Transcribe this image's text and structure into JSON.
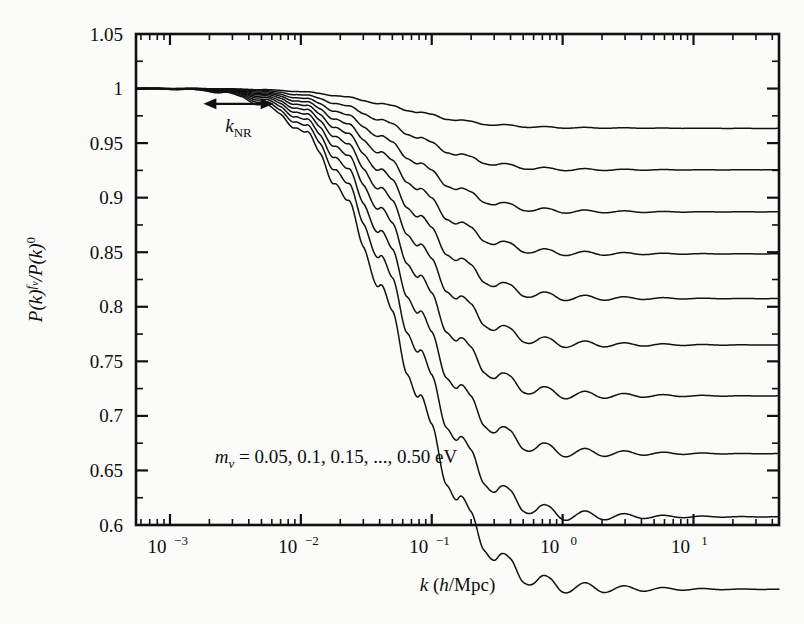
{
  "figure": {
    "background_color": "#fbfbf9",
    "line_color": "#111111",
    "axis_color": "#111111"
  },
  "axes": {
    "x_label_parts": {
      "k": "k",
      "open": " (",
      "h": "h",
      "rest": "/Mpc)"
    },
    "x_label": "k (h/Mpc)",
    "y_label": "P(k)^{f_v}/P(k)^0",
    "y_label_parts": {
      "p1": "P(k)",
      "sup1": "f",
      "sup1b": "v",
      "mid": "/P(k)",
      "sup2": "0"
    },
    "x_tick_labels": [
      "10-3",
      "10-2",
      "10-1",
      "100",
      "101"
    ],
    "x_tick_mantissa": "10",
    "x_tick_exponents": [
      "−3",
      "−2",
      "−1",
      "0",
      "1"
    ],
    "x_tick_values": [
      0.001,
      0.01,
      0.1,
      1,
      10
    ],
    "y_tick_labels": [
      "1.05",
      "1",
      "0.95",
      "0.9",
      "0.85",
      "0.8",
      "0.75",
      "0.7",
      "0.65",
      "0.6"
    ],
    "y_tick_values": [
      1.05,
      1,
      0.95,
      0.9,
      0.85,
      0.8,
      0.75,
      0.7,
      0.65,
      0.6
    ]
  },
  "annotations": {
    "arrow_label": "kNR",
    "arrow_label_parts": {
      "k": "k",
      "sub": "NR"
    },
    "arrow_x_range": [
      0.0018,
      0.0062
    ],
    "arrow_y": 0.986,
    "legend_text": "mv = 0.05, 0.1, 0.15, ..., 0.50 eV",
    "legend_parts": {
      "m": "m",
      "sub": "v",
      "rest": " = 0.05, 0.1, 0.15, ..., 0.50 eV"
    },
    "legend_x": 0.0022,
    "legend_y": 0.657
  },
  "chart_data": {
    "type": "line",
    "title": "",
    "xlabel": "k (h/Mpc)",
    "ylabel": "P(k)^{f_v}/P(k)^0",
    "xscale": "log",
    "yscale": "linear",
    "xlim": [
      0.00055,
      45
    ],
    "ylim": [
      0.6,
      1.05
    ],
    "grid": false,
    "legend": "annotation-inside-plot",
    "x": [
      0.00055,
      0.0008,
      0.0012,
      0.0018,
      0.0025,
      0.0035,
      0.005,
      0.007,
      0.009,
      0.011,
      0.014,
      0.018,
      0.023,
      0.03,
      0.04,
      0.05,
      0.065,
      0.08,
      0.1,
      0.13,
      0.16,
      0.2,
      0.25,
      0.32,
      0.4,
      0.5,
      0.65,
      0.8,
      1.0,
      1.4,
      2.0,
      3.0,
      5.0,
      8.0,
      13.0,
      20.0,
      30.0,
      45.0
    ],
    "series": [
      {
        "name": "m_v = 0.05 eV",
        "mass_eV": 0.05,
        "plateau": 0.9635,
        "values": [
          1.0,
          1.0,
          1.0,
          1.0,
          0.9998,
          0.9995,
          0.999,
          0.9983,
          0.9975,
          0.9968,
          0.9955,
          0.9938,
          0.9918,
          0.9893,
          0.9862,
          0.9838,
          0.9806,
          0.9782,
          0.9756,
          0.9727,
          0.9709,
          0.9692,
          0.9678,
          0.9665,
          0.9659,
          0.9653,
          0.9647,
          0.9644,
          0.9642,
          0.964,
          0.9639,
          0.9638,
          0.9637,
          0.9636,
          0.9636,
          0.9635,
          0.9635,
          0.9635
        ]
      },
      {
        "name": "m_v = 0.1 eV",
        "mass_eV": 0.1,
        "plateau": 0.9255,
        "values": [
          1.0,
          1.0,
          1.0,
          0.9999,
          0.9996,
          0.999,
          0.998,
          0.9965,
          0.995,
          0.9935,
          0.9908,
          0.9872,
          0.983,
          0.9778,
          0.9714,
          0.9664,
          0.9597,
          0.9548,
          0.9492,
          0.9432,
          0.9394,
          0.936,
          0.933,
          0.9303,
          0.929,
          0.9278,
          0.9267,
          0.9262,
          0.9259,
          0.9257,
          0.9256,
          0.9256,
          0.9255,
          0.9255,
          0.9255,
          0.9255,
          0.9255,
          0.9255
        ]
      },
      {
        "name": "m_v = 0.15 eV",
        "mass_eV": 0.15,
        "plateau": 0.8875,
        "values": [
          1.0,
          1.0,
          0.9999,
          0.9998,
          0.9993,
          0.9985,
          0.9969,
          0.9947,
          0.9924,
          0.9901,
          0.9861,
          0.9805,
          0.9741,
          0.9662,
          0.9564,
          0.9488,
          0.9386,
          0.9312,
          0.9227,
          0.9136,
          0.9078,
          0.9027,
          0.8982,
          0.8941,
          0.8922,
          0.8904,
          0.8888,
          0.8881,
          0.8876,
          0.8873,
          0.8872,
          0.8871,
          0.887,
          0.887,
          0.887,
          0.887,
          0.887,
          0.887
        ]
      },
      {
        "name": "m_v = 0.2 eV",
        "mass_eV": 0.2,
        "plateau": 0.8495,
        "values": [
          1.0,
          1.0,
          0.9999,
          0.9997,
          0.9991,
          0.998,
          0.9958,
          0.9929,
          0.9898,
          0.9867,
          0.9813,
          0.9738,
          0.9652,
          0.9546,
          0.9415,
          0.9313,
          0.9176,
          0.9077,
          0.8963,
          0.8841,
          0.8763,
          0.8695,
          0.8635,
          0.858,
          0.8554,
          0.853,
          0.8509,
          0.85,
          0.8493,
          0.8489,
          0.8487,
          0.8486,
          0.8486,
          0.8485,
          0.8485,
          0.8485,
          0.8485,
          0.8485
        ]
      },
      {
        "name": "m_v = 0.25 eV",
        "mass_eV": 0.25,
        "plateau": 0.8105,
        "values": [
          1.0,
          0.9999,
          0.9998,
          0.9995,
          0.9988,
          0.9974,
          0.9946,
          0.9909,
          0.987,
          0.9831,
          0.9762,
          0.9667,
          0.9558,
          0.9423,
          0.9256,
          0.9127,
          0.8953,
          0.8827,
          0.8683,
          0.8528,
          0.8429,
          0.8342,
          0.8267,
          0.8197,
          0.8164,
          0.8134,
          0.8107,
          0.8096,
          0.8087,
          0.8082,
          0.8079,
          0.8078,
          0.8077,
          0.8076,
          0.8076,
          0.8075,
          0.8075,
          0.8075
        ]
      },
      {
        "name": "m_v = 0.3 eV",
        "mass_eV": 0.3,
        "plateau": 0.7715,
        "values": [
          1.0,
          0.9999,
          0.9997,
          0.9993,
          0.9984,
          0.9967,
          0.9932,
          0.9886,
          0.9838,
          0.979,
          0.9705,
          0.9589,
          0.9455,
          0.9291,
          0.9086,
          0.8929,
          0.8717,
          0.8563,
          0.8388,
          0.8199,
          0.8079,
          0.7973,
          0.7882,
          0.7797,
          0.7757,
          0.7721,
          0.7688,
          0.7675,
          0.7664,
          0.7658,
          0.7655,
          0.7653,
          0.7652,
          0.7651,
          0.7651,
          0.765,
          0.765,
          0.765
        ]
      },
      {
        "name": "m_v = 0.35 eV",
        "mass_eV": 0.35,
        "plateau": 0.7325,
        "values": [
          1.0,
          0.9999,
          0.9996,
          0.9991,
          0.998,
          0.9959,
          0.9917,
          0.9861,
          0.9804,
          0.9746,
          0.9644,
          0.9504,
          0.9344,
          0.9147,
          0.8901,
          0.8713,
          0.8459,
          0.8275,
          0.8065,
          0.7838,
          0.7695,
          0.7568,
          0.7459,
          0.7358,
          0.731,
          0.7267,
          0.7228,
          0.7212,
          0.72,
          0.7192,
          0.7188,
          0.7186,
          0.7185,
          0.7184,
          0.7184,
          0.7183,
          0.7183,
          0.7183
        ]
      },
      {
        "name": "m_v = 0.4 eV",
        "mass_eV": 0.4,
        "plateau": 0.6955,
        "values": [
          1.0,
          0.9998,
          0.9995,
          0.9989,
          0.9975,
          0.9949,
          0.9899,
          0.9832,
          0.9764,
          0.9695,
          0.9573,
          0.9406,
          0.9216,
          0.8981,
          0.8689,
          0.8466,
          0.8164,
          0.7947,
          0.7698,
          0.7429,
          0.726,
          0.711,
          0.698,
          0.6861,
          0.6804,
          0.6753,
          0.6707,
          0.6688,
          0.6673,
          0.6664,
          0.6659,
          0.6657,
          0.6656,
          0.6655,
          0.6655,
          0.6654,
          0.6654,
          0.6654
        ]
      },
      {
        "name": "m_v = 0.45 eV",
        "mass_eV": 0.45,
        "plateau": 0.6605,
        "values": [
          1.0,
          0.9998,
          0.9994,
          0.9986,
          0.997,
          0.9938,
          0.9879,
          0.9799,
          0.9719,
          0.9638,
          0.9495,
          0.9298,
          0.9075,
          0.88,
          0.8458,
          0.8196,
          0.7843,
          0.7589,
          0.7297,
          0.6982,
          0.6784,
          0.6609,
          0.6456,
          0.6317,
          0.625,
          0.6191,
          0.6137,
          0.6115,
          0.6097,
          0.6086,
          0.6081,
          0.6079,
          0.6077,
          0.6076,
          0.6076,
          0.6075,
          0.6075,
          0.6075
        ]
      },
      {
        "name": "m_v = 0.50 eV",
        "mass_eV": 0.5,
        "plateau": 0.6275,
        "values": [
          1.0,
          0.9998,
          0.9993,
          0.9983,
          0.9964,
          0.9926,
          0.9856,
          0.9762,
          0.9668,
          0.9573,
          0.9405,
          0.9174,
          0.8913,
          0.8591,
          0.8191,
          0.7885,
          0.7473,
          0.7176,
          0.6836,
          0.6468,
          0.6237,
          0.6033,
          0.5855,
          0.5693,
          0.5615,
          0.5546,
          0.5483,
          0.5458,
          0.5437,
          0.5424,
          0.5418,
          0.5415,
          0.5413,
          0.5412,
          0.5412,
          0.5411,
          0.5411,
          0.5411
        ]
      }
    ]
  }
}
